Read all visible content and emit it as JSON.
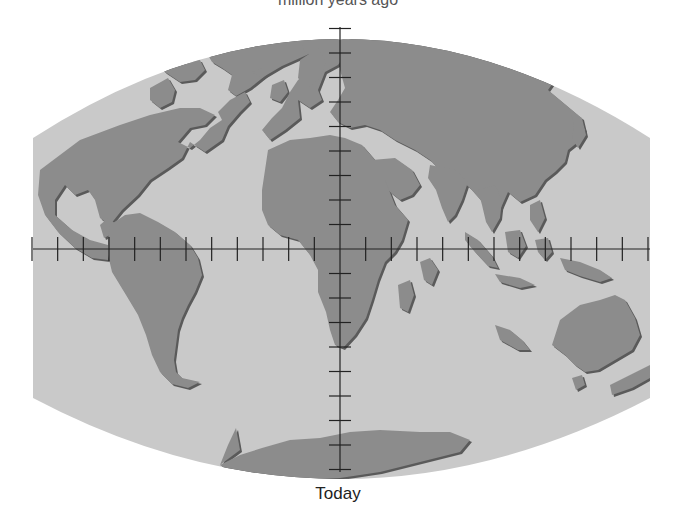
{
  "figure": {
    "top_caption": "million years ago",
    "bottom_caption": "Today",
    "map_type": "world map with continental positions (present day)",
    "colors": {
      "ocean": "#c9c9c9",
      "land": "#8c8c8c",
      "land_shadow": "#5a5a5a",
      "grid_line": "#222222",
      "background": "#ffffff"
    },
    "axes": {
      "equator_ticks_per_side": 12,
      "meridian_ticks_above_equator": 9,
      "meridian_ticks_below_equator": 9
    },
    "landmasses": [
      "North America",
      "Greenland",
      "South America",
      "Europe",
      "Africa",
      "Asia",
      "Arabia",
      "India",
      "Southeast Asia islands",
      "Japan",
      "Madagascar",
      "Australia",
      "New Zealand",
      "Antarctica"
    ]
  }
}
